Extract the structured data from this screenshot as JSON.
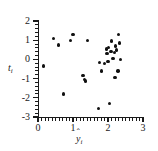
{
  "chart_data": {
    "type": "scatter",
    "title": "",
    "xlabel": "ŷᵢ",
    "ylabel": "tᵢ",
    "xlim": [
      0,
      3
    ],
    "ylim": [
      -3,
      2
    ],
    "xticks": [
      0,
      1,
      2,
      3
    ],
    "yticks": [
      2,
      1,
      0,
      -1,
      -2,
      -3
    ],
    "xtick_labels": [
      "0",
      "1",
      "2",
      "3"
    ],
    "ytick_labels": [
      "2",
      "1",
      "0",
      "-1",
      "-2",
      "-3"
    ],
    "grid": false,
    "legend": "none",
    "marker": "filled-circle",
    "marker_color": "#111111",
    "points": [
      {
        "x": 0.15,
        "y": -0.35
      },
      {
        "x": 0.45,
        "y": 1.1
      },
      {
        "x": 0.58,
        "y": 0.75
      },
      {
        "x": 0.72,
        "y": -1.8
      },
      {
        "x": 0.93,
        "y": 1.0
      },
      {
        "x": 1.0,
        "y": 1.3
      },
      {
        "x": 1.28,
        "y": -0.85
      },
      {
        "x": 1.33,
        "y": -1.05
      },
      {
        "x": 1.36,
        "y": -1.12
      },
      {
        "x": 1.42,
        "y": 1.0
      },
      {
        "x": 1.72,
        "y": -2.55
      },
      {
        "x": 1.75,
        "y": -0.15
      },
      {
        "x": 1.82,
        "y": -0.6
      },
      {
        "x": 1.9,
        "y": -0.2
      },
      {
        "x": 1.95,
        "y": 0.55
      },
      {
        "x": 1.97,
        "y": 0.3
      },
      {
        "x": 2.0,
        "y": -0.1
      },
      {
        "x": 2.02,
        "y": 0.62
      },
      {
        "x": 2.05,
        "y": -2.3
      },
      {
        "x": 2.08,
        "y": 0.42
      },
      {
        "x": 2.1,
        "y": 0.95
      },
      {
        "x": 2.14,
        "y": 0.05
      },
      {
        "x": 2.18,
        "y": 0.35
      },
      {
        "x": 2.2,
        "y": -0.95
      },
      {
        "x": 2.22,
        "y": 0.7
      },
      {
        "x": 2.25,
        "y": 0.5
      },
      {
        "x": 2.28,
        "y": -0.6
      },
      {
        "x": 2.3,
        "y": 1.3
      },
      {
        "x": 2.33,
        "y": 0.85
      },
      {
        "x": 2.36,
        "y": 0.0
      }
    ],
    "xminor_step": 0.1,
    "yminor_step": 0.2
  }
}
